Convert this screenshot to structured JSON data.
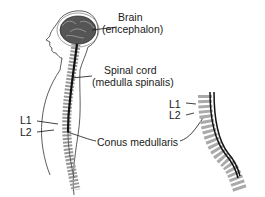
{
  "diagram": {
    "labels": {
      "brain": "Brain",
      "brain_latin": "(encephalon)",
      "spinal_cord": "Spinal cord",
      "spinal_cord_latin": "(medulla spinalis)",
      "conus": "Conus medullaris",
      "l1_left": "L1",
      "l2_left": "L2",
      "l1_right": "L1",
      "l2_right": "L2"
    },
    "figures": [
      {
        "name": "full-body-sagittal-view",
        "position": "left"
      },
      {
        "name": "lumbar-spine-detail",
        "position": "right"
      }
    ]
  }
}
